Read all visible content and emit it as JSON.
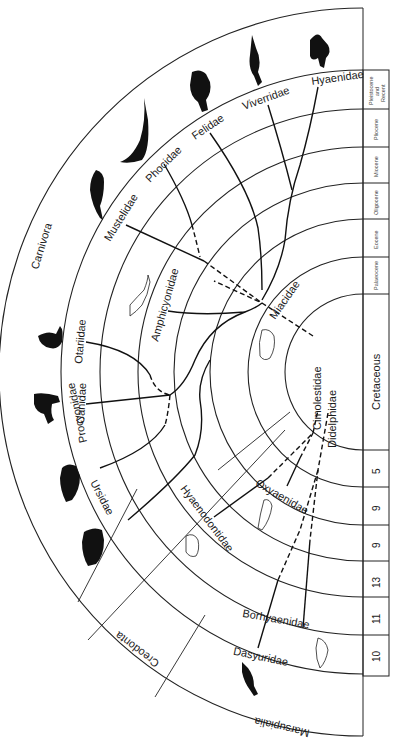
{
  "orders": {
    "carnivora": "Carnivora",
    "creodonta": "Creodonta",
    "marsupialia": "Marsupialia"
  },
  "timeline": {
    "epochs": [
      {
        "label_lines": [
          "Pleistocene",
          "and",
          "Recent"
        ]
      },
      {
        "label": "Pliocene"
      },
      {
        "label": "Miocene"
      },
      {
        "label": "Oligocene"
      },
      {
        "label": "Eocene"
      },
      {
        "label": "Palaeocene"
      },
      {
        "label": "Cretaceous"
      }
    ],
    "counts": [
      "5",
      "9",
      "9",
      "13",
      "11",
      "10"
    ]
  },
  "families": {
    "carnivora": [
      "Hyaenidae",
      "Viverridae",
      "Felidae",
      "Phocidae",
      "Mustelidae",
      "Amphicyonidae",
      "Otariidae",
      "Canidae",
      "Procyonidae",
      "Ursidae"
    ],
    "ancestral": [
      "Miacidae",
      "Cimolestidae",
      "Didelphidae"
    ],
    "creodonta": [
      "Hyaenodontidae",
      "Oxyaenidae"
    ],
    "marsupialia": [
      "Borhyaenidae",
      "Dasyuridae"
    ]
  },
  "silhouettes": [
    "hyena",
    "civet",
    "cat",
    "seal",
    "weasel",
    "sea-lion",
    "dog",
    "raccoon",
    "bear",
    "thylacine",
    "amphicyonid-sketch",
    "miacid-sketch",
    "hyaenodont-sketch",
    "oxyaenid-sketch",
    "borhyaenid-sketch"
  ]
}
